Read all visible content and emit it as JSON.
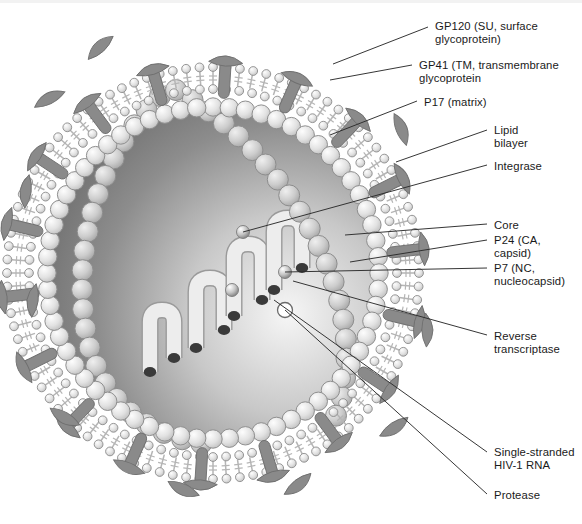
{
  "figure": {
    "type": "labeled-biological-diagram",
    "background_color": "#ffffff"
  },
  "palette": {
    "spike_gray": "#8a8a8a",
    "spike_stroke": "#6f6f6f",
    "head_fill": "#e3e3e3",
    "head_stroke": "#8c8c8c",
    "tail_gray": "#b5b5b5",
    "matrix_fill": "#e0e0e0",
    "matrix_stroke": "#8f8f8f",
    "interior_dark": "#7d7d7d",
    "interior_light": "#f4f4f4",
    "capsid_fill": "#c9c9c9",
    "capsid_stroke": "#8d8d8d",
    "rna_fill": "#ededed",
    "rna_stroke": "#9a9a9a",
    "rna_cap": "#3a3a3a",
    "leader_line": "#2b2b2b",
    "text_color": "#1a1a1a"
  },
  "labels": [
    {
      "id": "gp120",
      "text": "GP120 (SU, surface\nglycoprotein)",
      "x": 435,
      "y": 20,
      "leader": {
        "x1": 428,
        "y1": 27,
        "x2": 333,
        "y2": 64
      }
    },
    {
      "id": "gp41",
      "text": "GP41 (TM, transmembrane\nglycoprotein",
      "x": 419,
      "y": 59,
      "leader": {
        "x1": 412,
        "y1": 65,
        "x2": 330,
        "y2": 80
      }
    },
    {
      "id": "p17",
      "text": "P17 (matrix)",
      "x": 424,
      "y": 96,
      "leader": {
        "x1": 417,
        "y1": 101,
        "x2": 330,
        "y2": 135
      }
    },
    {
      "id": "lipid",
      "text": "Lipid\nbilayer",
      "x": 494,
      "y": 124,
      "leader": {
        "x1": 487,
        "y1": 130,
        "x2": 396,
        "y2": 162
      }
    },
    {
      "id": "integrase",
      "text": "Integrase",
      "x": 494,
      "y": 160,
      "leader": {
        "x1": 487,
        "y1": 165,
        "x2": 243,
        "y2": 232
      }
    },
    {
      "id": "core",
      "text": "Core",
      "x": 494,
      "y": 219,
      "leader": {
        "x1": 487,
        "y1": 224,
        "x2": 345,
        "y2": 235
      }
    },
    {
      "id": "p24",
      "text": "P24 (CA,\ncapsid)",
      "x": 494,
      "y": 234,
      "leader": {
        "x1": 487,
        "y1": 240,
        "x2": 350,
        "y2": 262
      }
    },
    {
      "id": "p7",
      "text": "P7 (NC,\nnucleocapsid)",
      "x": 494,
      "y": 262,
      "leader": {
        "x1": 487,
        "y1": 268,
        "x2": 285,
        "y2": 272
      }
    },
    {
      "id": "rt",
      "text": "Reverse\ntranscriptase",
      "x": 494,
      "y": 330,
      "leader": {
        "x1": 487,
        "y1": 335,
        "x2": 293,
        "y2": 281
      }
    },
    {
      "id": "rna",
      "text": "Single-stranded\nHIV-1 RNA",
      "x": 494,
      "y": 446,
      "leader": {
        "x1": 487,
        "y1": 452,
        "x2": 274,
        "y2": 300
      }
    },
    {
      "id": "protease",
      "text": "Protease",
      "x": 494,
      "y": 489,
      "leader": {
        "x1": 487,
        "y1": 494,
        "x2": 285,
        "y2": 310
      }
    }
  ],
  "virion": {
    "center_x": 213,
    "center_y": 273,
    "envelope_outer_radius": 213,
    "bilayer_head_radius_outer": 206,
    "bilayer_head_radius_inner": 184,
    "matrix_ring_radius": 166,
    "matrix_bead_radius": 9.2,
    "matrix_bead_count": 64,
    "head_bead_count_outer": 96,
    "head_bead_count_inner": 88,
    "head_bead_radius": 4.4,
    "spike_count": 18,
    "spike_rod_length": 40,
    "spike_rod_width": 11,
    "gp120_cap_length": 34,
    "gp120_cap_width": 12,
    "free_gp120_count": 10,
    "capsid_bead_radius": 10.5,
    "interior_gradient": {
      "from": "#6f6f6f",
      "to": "#f6f6f6"
    }
  },
  "core": {
    "description": "cone-shaped capsid enclosing coiled single-stranded RNA",
    "left_wall": "M 160 96 C 104 150 74 236 84 318 C 92 392 140 436 206 444",
    "right_wall": "M 176 90 C 246 130 300 196 330 272 C 352 330 352 384 330 430"
  },
  "rna_strands": [
    {
      "id": "rna-1",
      "path": "M 150 372 L 150 322 Q 150 310 162 310 Q 174 310 174 322 L 174 358"
    },
    {
      "id": "rna-2",
      "path": "M 196 348 L 196 292 Q 196 278 210 278 Q 224 278 224 292 L 224 330"
    },
    {
      "id": "rna-3",
      "path": "M 234 316 L 234 258 Q 234 244 248 244 Q 262 244 262 258 L 262 300"
    },
    {
      "id": "rna-4",
      "path": "M 274 290 L 274 232 Q 274 218 288 218 Q 302 218 302 232 L 302 268"
    }
  ],
  "markers": [
    {
      "id": "integrase-sphere",
      "kind": "sphere",
      "x": 243,
      "y": 232,
      "r": 6.5,
      "label_ref": "integrase"
    },
    {
      "id": "p7-sphere",
      "kind": "sphere",
      "x": 285,
      "y": 272,
      "r": 6.5,
      "label_ref": "p7"
    },
    {
      "id": "rt-sphere",
      "kind": "sphere",
      "x": 232,
      "y": 290,
      "r": 6.5,
      "label_ref": "rt"
    },
    {
      "id": "protease-circle",
      "kind": "open-circle",
      "x": 285,
      "y": 310,
      "r": 7.5,
      "label_ref": "protease"
    }
  ]
}
